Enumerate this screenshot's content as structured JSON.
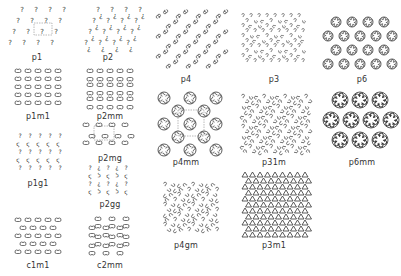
{
  "figure": {
    "panels": [
      {
        "id": "p1",
        "label": "p1"
      },
      {
        "id": "p2",
        "label": "p2"
      },
      {
        "id": "p1m1",
        "label": "p1m1"
      },
      {
        "id": "p2mm",
        "label": "p2mm"
      },
      {
        "id": "p1g1",
        "label": "p1g1"
      },
      {
        "id": "p2mg",
        "label": "p2mg"
      },
      {
        "id": "p2gg",
        "label": "p2gg"
      },
      {
        "id": "c1m1",
        "label": "c1m1"
      },
      {
        "id": "c2mm",
        "label": "c2mm"
      },
      {
        "id": "p4",
        "label": "p4"
      },
      {
        "id": "p3",
        "label": "p3"
      },
      {
        "id": "p6",
        "label": "p6"
      },
      {
        "id": "p4mm",
        "label": "p4mm"
      },
      {
        "id": "p31m",
        "label": "p31m"
      },
      {
        "id": "p6mm",
        "label": "p6mm"
      },
      {
        "id": "p4gm",
        "label": "p4gm"
      },
      {
        "id": "p3m1",
        "label": "p3m1"
      }
    ]
  },
  "colors": {
    "ink": "#333333",
    "background": "#ffffff",
    "unit_cell": "#777777"
  }
}
